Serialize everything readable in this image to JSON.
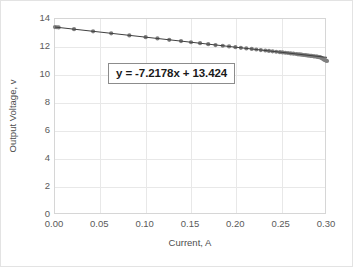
{
  "chart_data": {
    "type": "scatter",
    "title": "",
    "xlabel": "Current, A",
    "ylabel": "Output Voltage, v",
    "xlim": [
      0.0,
      0.3
    ],
    "ylim": [
      0,
      14
    ],
    "grid": true,
    "legend": false,
    "annotations": [
      {
        "name": "trendline-equation",
        "text": "y = -7.2178x + 13.424",
        "slope": -7.2178,
        "intercept": 13.424
      }
    ],
    "xticks": [
      "0.00",
      "0.05",
      "0.10",
      "0.15",
      "0.20",
      "0.25",
      "0.30"
    ],
    "xtick_values": [
      0.0,
      0.05,
      0.1,
      0.15,
      0.2,
      0.25,
      0.3
    ],
    "yticks": [
      "0",
      "2",
      "4",
      "6",
      "8",
      "10",
      "12",
      "14"
    ],
    "ytick_values": [
      0,
      2,
      4,
      6,
      8,
      10,
      12,
      14
    ],
    "series": [
      {
        "name": "Output Voltage vs Current",
        "marker": "circle",
        "marker_color": "#7f7f7f",
        "line_color": "#404040",
        "x": [
          0.0,
          0.002,
          0.004,
          0.021,
          0.042,
          0.062,
          0.082,
          0.1,
          0.113,
          0.126,
          0.139,
          0.15,
          0.16,
          0.169,
          0.177,
          0.185,
          0.192,
          0.199,
          0.205,
          0.211,
          0.217,
          0.222,
          0.227,
          0.232,
          0.236,
          0.24,
          0.244,
          0.248,
          0.251,
          0.254,
          0.257,
          0.26,
          0.263,
          0.266,
          0.268,
          0.27,
          0.272,
          0.274,
          0.276,
          0.278,
          0.28,
          0.282,
          0.283,
          0.285,
          0.286,
          0.288,
          0.289,
          0.29,
          0.291,
          0.292,
          0.293,
          0.294,
          0.295,
          0.296,
          0.297,
          0.298,
          0.299,
          0.3
        ],
        "y": [
          13.42,
          13.41,
          13.4,
          13.27,
          13.12,
          12.98,
          12.83,
          12.7,
          12.61,
          12.51,
          12.42,
          12.34,
          12.27,
          12.2,
          12.14,
          12.09,
          12.04,
          11.99,
          11.94,
          11.9,
          11.86,
          11.82,
          11.78,
          11.75,
          11.72,
          11.69,
          11.66,
          11.63,
          11.61,
          11.59,
          11.57,
          11.54,
          11.52,
          11.5,
          11.48,
          11.47,
          11.45,
          11.43,
          11.42,
          11.4,
          11.38,
          11.37,
          11.36,
          11.34,
          11.33,
          11.32,
          11.31,
          11.3,
          11.28,
          11.27,
          11.25,
          11.22,
          11.18,
          11.13,
          11.09,
          11.06,
          11.03,
          11.0
        ]
      }
    ],
    "trendline": {
      "name": "linear-trendline",
      "slope": -7.2178,
      "intercept": 13.424,
      "x_start": 0.0,
      "x_end": 0.3,
      "color": "#404040"
    }
  }
}
